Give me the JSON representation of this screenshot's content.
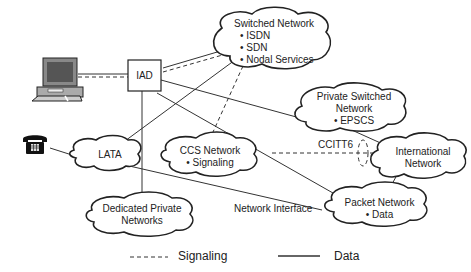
{
  "diagram": {
    "nodes": {
      "iad": {
        "label": "IAD"
      },
      "switched": {
        "title": "Switched Network",
        "items": [
          "• ISDN",
          "• SDN",
          "• Nodal Services"
        ]
      },
      "private_switched": {
        "title1": "Private Switched",
        "title2": "Network",
        "items": [
          "• EPSCS"
        ]
      },
      "international": {
        "title1": "International",
        "title2": "Network"
      },
      "lata": {
        "label": "LATA"
      },
      "ccs": {
        "title": "CCS Network",
        "items": [
          "• Signaling"
        ]
      },
      "dedicated": {
        "title1": "Dedicated Private",
        "title2": "Networks"
      },
      "packet": {
        "title": "Packet Network",
        "items": [
          "• Data"
        ]
      }
    },
    "edge_labels": {
      "ccitt6": "CCITT6",
      "network_interface": "Network Interface"
    },
    "legend": {
      "signaling": "Signaling",
      "data": "Data"
    },
    "colors": {
      "line": "#333333",
      "text": "#222222"
    }
  }
}
